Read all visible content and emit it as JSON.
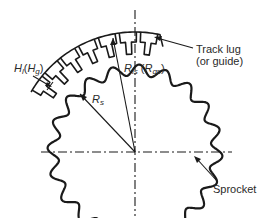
{
  "diagram": {
    "colors": {
      "line": "#1a1a1a",
      "text": "#2a2a2a",
      "background": "#ffffff"
    },
    "labels": {
      "hl": {
        "main": "H",
        "main_sub": "l",
        "paren_open": "(",
        "alt": "H",
        "alt_sub": "g",
        "paren_close": ")"
      },
      "rs": {
        "main": "R",
        "sub": "s"
      },
      "rls": {
        "main": "R",
        "sub": "ls",
        "paren_open": " (",
        "alt": "R",
        "alt_sub": "gs",
        "paren_close": ")"
      },
      "track_lug": {
        "line1": "Track lug",
        "line2": "(or guide)"
      },
      "sprocket": "Sprocket"
    },
    "geometry": {
      "center": [
        135,
        152
      ],
      "sprocket_teeth": 20,
      "sprocket_radius_mean": 82,
      "track_arc_radius": 120
    }
  }
}
